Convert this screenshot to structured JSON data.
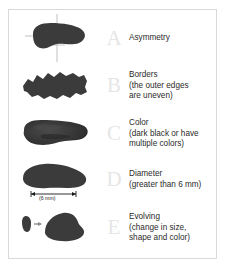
{
  "figure": {
    "letter_color": "#e6e6e6",
    "text_color": "#2b2b2b",
    "lesion_color": "#3a3a3a",
    "frame_color": "#d9d9d9",
    "background": "#ffffff"
  },
  "rows": [
    {
      "letter": "A",
      "title": "Asymmetry",
      "sub_lines": [],
      "icon": "asymmetric-mole-with-crosshair"
    },
    {
      "letter": "B",
      "title": "Borders",
      "sub_lines": [
        "(the outer edges",
        "are uneven)"
      ],
      "icon": "irregular-border-mole"
    },
    {
      "letter": "C",
      "title": "Color",
      "sub_lines": [
        "(dark black or have",
        "multiple colors)"
      ],
      "icon": "multicolor-mole"
    },
    {
      "letter": "D",
      "title": "Diameter",
      "sub_lines": [
        "(greater than 6 mm)"
      ],
      "icon": "large-mole-with-measure"
    },
    {
      "letter": "E",
      "title": "Evolving",
      "sub_lines": [
        "(change in size,",
        "shape and color)"
      ],
      "icon": "evolving-mole-pair"
    }
  ],
  "measure": {
    "label": "(6 mm)"
  }
}
